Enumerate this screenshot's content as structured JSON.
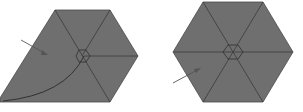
{
  "figure": {
    "colors": {
      "fill": "#6f6f6f",
      "stroke": "#3a3a3a",
      "arrow": "#555555",
      "background": "#ffffff"
    },
    "left_shape": {
      "name": "modified-hexagon-with-arc",
      "has_center_hexagon": true,
      "has_arc": true,
      "has_arrow": true
    },
    "right_shape": {
      "name": "regular-hexagon",
      "has_center_hexagon": true,
      "has_arrow": true
    }
  }
}
